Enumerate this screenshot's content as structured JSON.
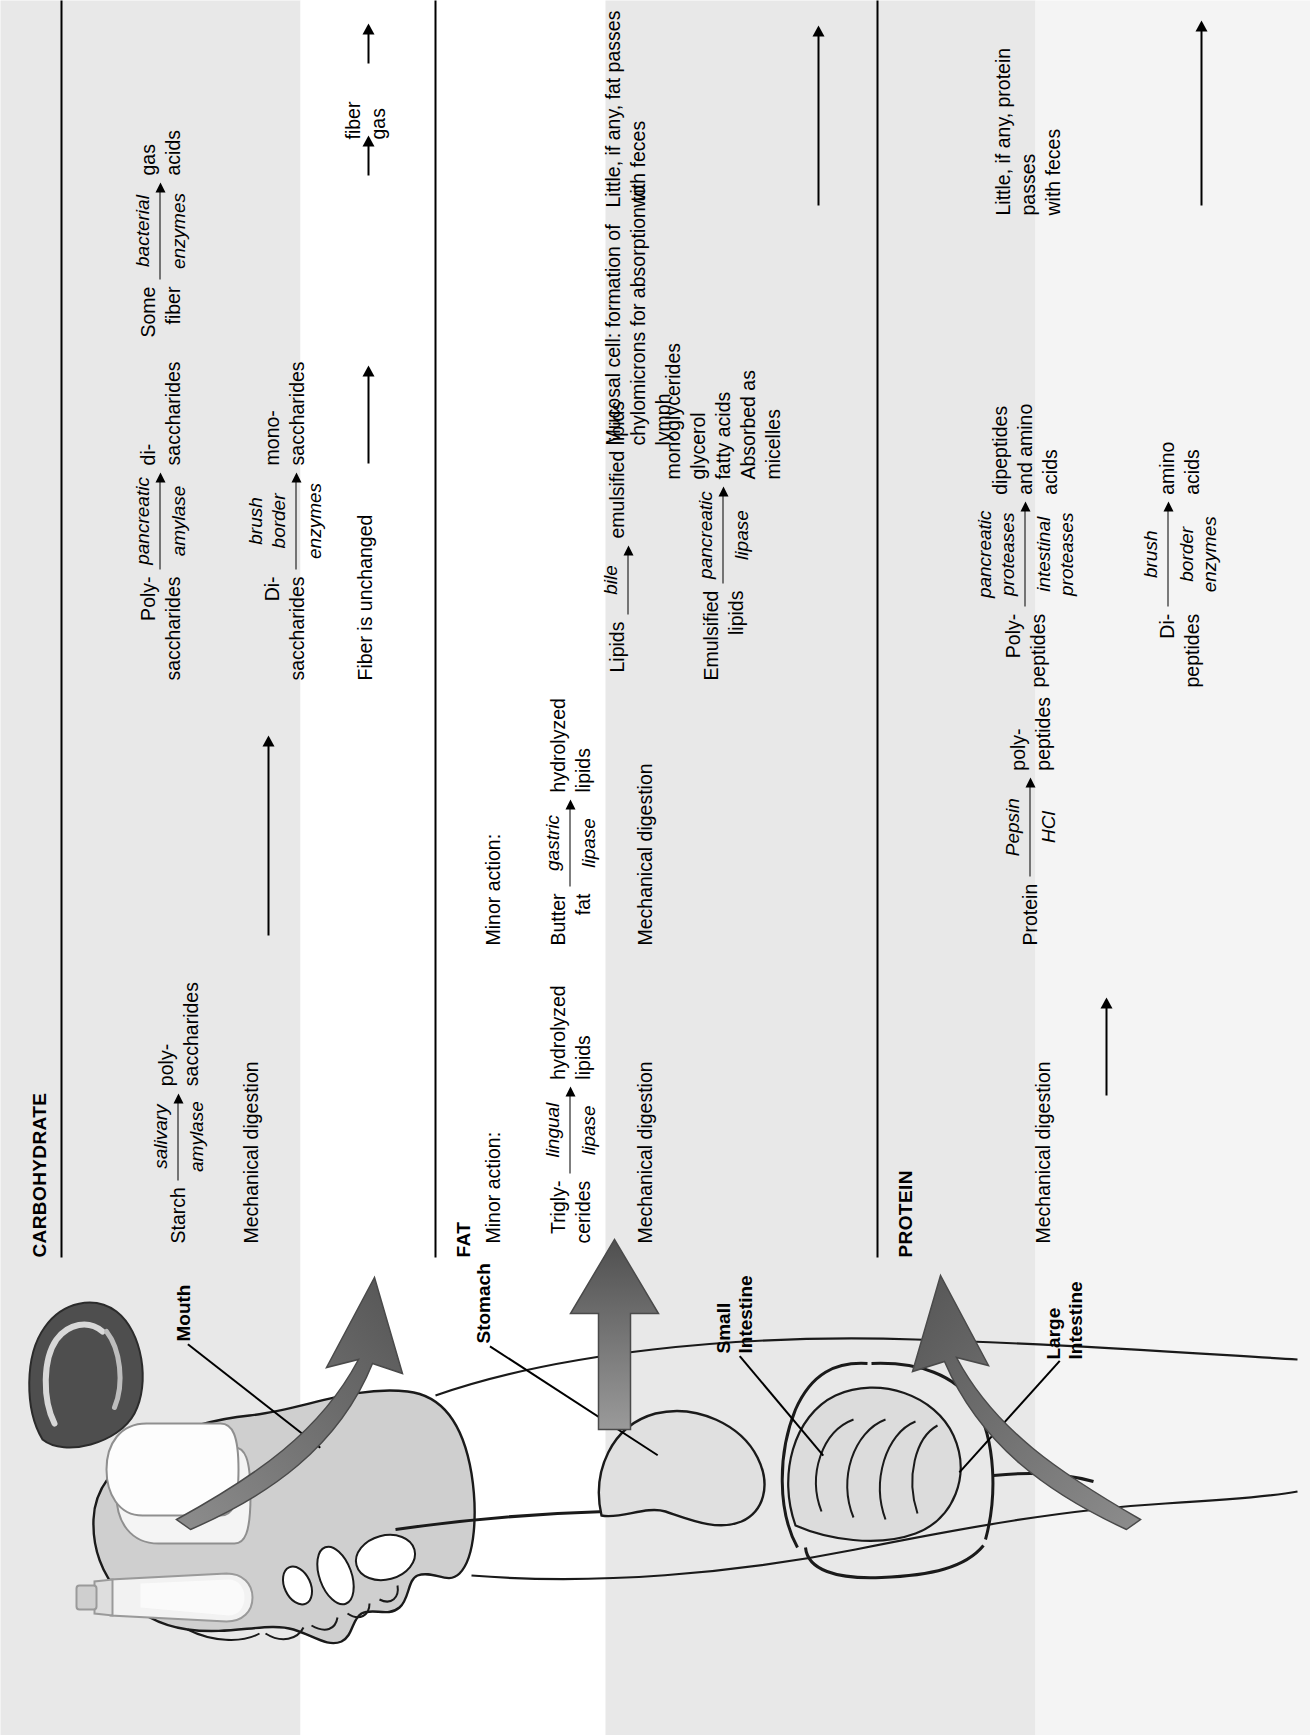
{
  "figure": {
    "orientation": "rotated-90-ccw",
    "columns": [
      "CARBOHYDRATE",
      "FAT",
      "PROTEIN"
    ],
    "rows": [
      "Mouth",
      "Stomach",
      "Small Intestine",
      "Large Intestine"
    ]
  },
  "headings": {
    "carbohydrate": "CARBOHYDRATE",
    "fat": "FAT",
    "protein": "PROTEIN"
  },
  "organs": {
    "mouth": "Mouth",
    "stomach": "Stomach",
    "small_intestine": "Small\nIntestine",
    "large_intestine": "Large\nIntestine"
  },
  "carbohydrate": {
    "mouth": {
      "reaction": {
        "substrate": "Starch",
        "enzyme_above": "salivary",
        "enzyme_below": "amylase",
        "product": "poly-\nsaccharides"
      },
      "note": "Mechanical digestion"
    },
    "stomach": {
      "note": ""
    },
    "small_intestine": {
      "reaction1": {
        "substrate": "Poly-\nsaccharides",
        "enzyme_above": "pancreatic",
        "enzyme_below": "amylase",
        "product": "di-\nsaccharides"
      },
      "reaction2": {
        "substrate": "Di-\nsaccharides",
        "enzyme_above": "brush\nborder",
        "enzyme_below": "enzymes",
        "product": "mono-\nsaccharides"
      },
      "note": "Fiber is unchanged"
    },
    "large_intestine": {
      "reaction": {
        "substrate": "Some\nfiber",
        "enzyme_above": "bacterial",
        "enzyme_below": "enzymes",
        "product": "gas\nacids"
      },
      "passthrough": "fiber\ngas"
    }
  },
  "fat": {
    "mouth": {
      "minor_action": "Minor action:",
      "reaction": {
        "substrate": "Trigly-\ncerides",
        "enzyme_above": "lingual",
        "enzyme_below": "lipase",
        "product": "hydrolyzed\nlipids"
      },
      "note": "Mechanical digestion"
    },
    "stomach": {
      "minor_action": "Minor action:",
      "reaction": {
        "substrate": "Butter\nfat",
        "enzyme_above": "gastric",
        "enzyme_below": "lipase",
        "product": "hydrolyzed\nlipids"
      },
      "note": "Mechanical digestion"
    },
    "small_intestine": {
      "reaction1": {
        "substrate": "Lipids",
        "enzyme_above": "bile",
        "enzyme_below": "",
        "product": "emulsified lipids"
      },
      "reaction2": {
        "substrate": "Emulsified\nlipids",
        "enzyme_above": "pancreatic",
        "enzyme_below": "lipase",
        "product": "monoglycerides\nglycerol\nfatty acids\nAbsorbed as\nmicelles"
      },
      "mucosal": "Mucosal cell: formation of\nchylomicrons for absorption to\nlymph"
    },
    "large_intestine": {
      "note": "Little, if any, fat passes\nwith feces"
    }
  },
  "protein": {
    "mouth": {
      "note": "Mechanical digestion"
    },
    "stomach": {
      "reaction": {
        "substrate": "Protein",
        "enzyme_above": "Pepsin",
        "enzyme_below": "HCl",
        "product": "poly-\npeptides"
      }
    },
    "small_intestine": {
      "reaction1": {
        "substrate": "Poly-\npeptides",
        "enzyme_above": "pancreatic\nproteases",
        "enzyme_below": "intestinal\nproteases",
        "product": "dipeptides\nand amino\nacids"
      },
      "reaction2": {
        "substrate": "Di-\npeptides",
        "enzyme_above": "brush",
        "enzyme_below": "border\nenzymes",
        "product": "amino\nacids"
      }
    },
    "large_intestine": {
      "note": "Little, if any, protein passes\nwith feces"
    }
  },
  "colors": {
    "band_shade": "#e8e8e8",
    "band_light": "#f4f4f4",
    "band_white": "#ffffff",
    "rule": "#000000",
    "arrow_gray": "#6f6f6f",
    "arrow_gray_dark": "#4d4d4d"
  }
}
